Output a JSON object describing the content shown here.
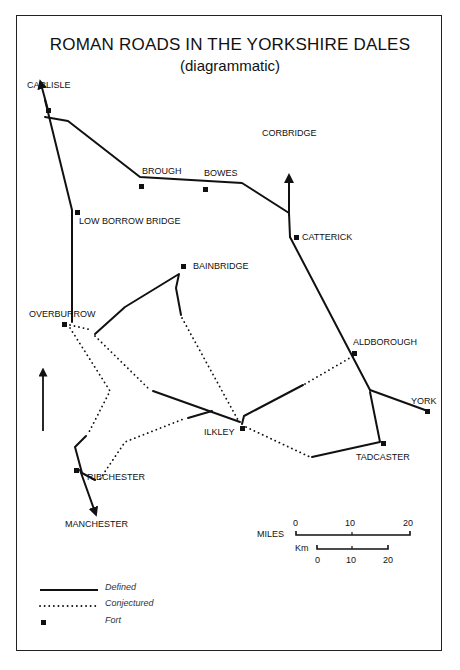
{
  "title": "ROMAN ROADS IN THE YORKSHIRE DALES",
  "subtitle": "(diagrammatic)",
  "places": {
    "carlisle": "CARLISLE",
    "brough": "BROUGH",
    "bowes": "BOWES",
    "corbridge": "CORBRIDGE",
    "low_borrow_bridge": "LOW BORROW BRIDGE",
    "catterick": "CATTERICK",
    "bainbridge": "BAINBRIDGE",
    "overburrow": "OVERBURROW",
    "aldborough": "ALDBOROUGH",
    "york": "YORK",
    "ilkley": "ILKLEY",
    "tadcaster": "TADCASTER",
    "ribchester": "RIBCHESTER",
    "manchester": "MANCHESTER"
  },
  "scale": {
    "miles_label": "MILES",
    "km_label": "Km",
    "miles_ticks": [
      "0",
      "10",
      "20"
    ],
    "km_ticks": [
      "0",
      "10",
      "20"
    ]
  },
  "legend": {
    "defined": "Defined",
    "conjectured": "Conjectured",
    "fort": "Fort"
  },
  "north_arrow": "north-arrow"
}
